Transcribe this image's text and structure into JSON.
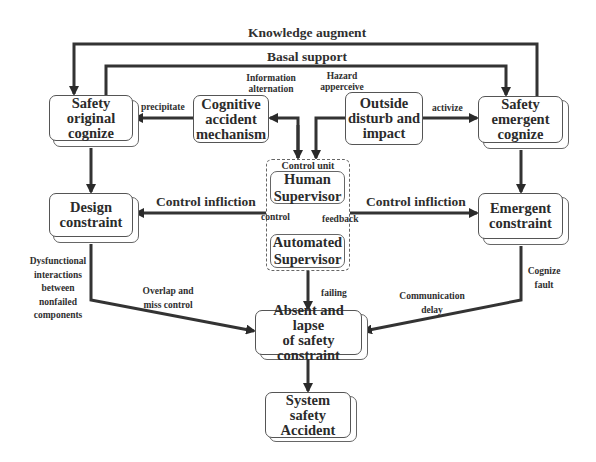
{
  "diagram": {
    "nodes": {
      "safety_original": "Safety\noriginal\ncognize",
      "cognitive_accident": "Cognitive\naccident\nmechanism",
      "outside_disturb": "Outside\ndisturb and\nimpact",
      "safety_emergent": "Safety\nemergent\ncognize",
      "control_unit_title": "Control unit",
      "human_supervisor": "Human\nSupervisor",
      "automated_supervisor": "Automated\nSupervisor",
      "design_constraint": "Design\nconstraint",
      "emergent_constraint": "Emergent\nconstraint",
      "absent_lapse": "Absent and lapse\nof safety\nconstraint",
      "system_accident": "System\nsafety\nAccident"
    },
    "edge_labels": {
      "knowledge_augment": "Knowledge augment",
      "basal_support": "Basal support",
      "information_alternation": "Information\nalternation",
      "hazard_apperceive": "Hazard\napperceive",
      "precipitate": "precipitate",
      "activize": "activize",
      "control_infliction_left": "Control infliction",
      "control_infliction_right": "Control infliction",
      "control": "control",
      "feedback": "feedback",
      "dysfunctional": "Dysfunctional\ninteractions\nbetween\nnonfailed\ncomponents",
      "overlap_miss": "Overlap and\nmiss control",
      "failing": "failing",
      "communication_delay": "Communication\ndelay",
      "cognize_fault": "Cognize\nfault"
    },
    "edges": [
      {
        "from": "safety_emergent",
        "to": "safety_original",
        "label": "Knowledge augment"
      },
      {
        "from": "safety_original",
        "to": "safety_emergent",
        "label": "Basal support"
      },
      {
        "from": "cognitive_accident",
        "to": "safety_original",
        "label": "precipitate"
      },
      {
        "from": "control_unit",
        "to": "cognitive_accident",
        "label": "Information alternation",
        "bidirectional": true
      },
      {
        "from": "outside_disturb",
        "to": "control_unit",
        "label": "Hazard apperceive"
      },
      {
        "from": "outside_disturb",
        "to": "safety_emergent",
        "label": "activize"
      },
      {
        "from": "safety_original",
        "to": "design_constraint"
      },
      {
        "from": "safety_emergent",
        "to": "emergent_constraint"
      },
      {
        "from": "control_unit",
        "to": "design_constraint",
        "label": "Control infliction"
      },
      {
        "from": "control_unit",
        "to": "emergent_constraint",
        "label": "Control infliction"
      },
      {
        "from": "human_supervisor",
        "to": "automated_supervisor",
        "label": "control"
      },
      {
        "from": "automated_supervisor",
        "to": "human_supervisor",
        "label": "feedback"
      },
      {
        "from": "design_constraint",
        "to": "absent_lapse",
        "label": "Overlap and miss control"
      },
      {
        "from": "control_unit",
        "to": "absent_lapse",
        "label": "failing"
      },
      {
        "from": "emergent_constraint",
        "to": "absent_lapse",
        "label": "Communication delay"
      },
      {
        "from": "absent_lapse",
        "to": "system_accident"
      }
    ]
  }
}
